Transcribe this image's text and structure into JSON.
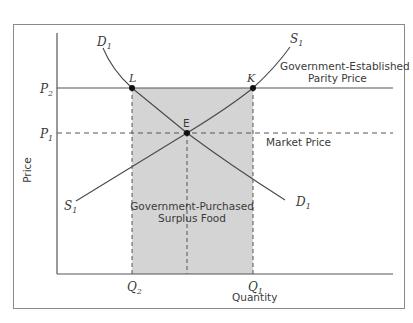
{
  "diagram": {
    "axes": {
      "x_label": "Quantity",
      "y_label": "Price"
    },
    "price_ticks": {
      "p2": {
        "main": "P",
        "sub": "2"
      },
      "p1": {
        "main": "P",
        "sub": "1"
      }
    },
    "quantity_ticks": {
      "q2": {
        "main": "Q",
        "sub": "2"
      },
      "q1": {
        "main": "Q",
        "sub": "1"
      }
    },
    "curves": {
      "demand_top": {
        "main": "D",
        "sub": "1"
      },
      "demand_bottom": {
        "main": "D",
        "sub": "1"
      },
      "supply_top": {
        "main": "S",
        "sub": "1"
      },
      "supply_bottom": {
        "main": "S",
        "sub": "1"
      }
    },
    "points": {
      "L": "L",
      "K": "K",
      "E": "E"
    },
    "annotations": {
      "parity_line1": "Government-Established",
      "parity_line2": "Parity Price",
      "market_price": "Market Price",
      "surplus_line1": "Government-Purchased",
      "surplus_line2": "Surplus Food"
    },
    "colors": {
      "frame": "#8a8a8a",
      "axis": "#555555",
      "curve": "#4a4a4a",
      "shade": "#d4d4d4",
      "point": "#111111",
      "text": "#3a3a3a"
    }
  }
}
